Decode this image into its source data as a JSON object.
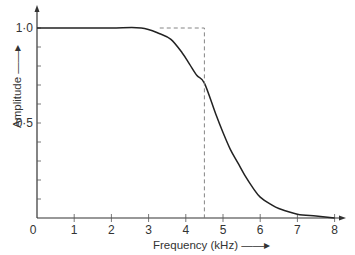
{
  "chart_data": {
    "type": "line",
    "title": "",
    "xlabel": "Frequency (kHz)",
    "ylabel": "Amplitude",
    "xlim": [
      0,
      8
    ],
    "ylim": [
      0,
      1.0
    ],
    "x_ticks": [
      "0",
      "1",
      "2",
      "3",
      "4",
      "5",
      "6",
      "7",
      "8"
    ],
    "y_ticks": [
      "1·0",
      "0·5"
    ],
    "y_minor_ticks_step": 0.1,
    "grid": false,
    "legend": null,
    "series": [
      {
        "name": "Filter response",
        "style": "solid",
        "x": [
          0,
          1,
          2,
          2.8,
          3.3,
          3.6,
          3.9,
          4.1,
          4.3,
          4.5,
          4.8,
          5.0,
          5.2,
          5.4,
          5.6,
          5.8,
          6.0,
          6.3,
          6.5,
          7.0,
          7.5,
          8.0
        ],
        "y": [
          1.0,
          1.0,
          1.0,
          1.0,
          0.97,
          0.94,
          0.87,
          0.81,
          0.75,
          0.71,
          0.55,
          0.45,
          0.36,
          0.29,
          0.22,
          0.16,
          0.11,
          0.07,
          0.05,
          0.02,
          0.01,
          0.0
        ]
      },
      {
        "name": "Ideal cutoff",
        "style": "dashed",
        "x": [
          3.3,
          4.5,
          4.5
        ],
        "y": [
          1.0,
          1.0,
          0.0
        ]
      }
    ]
  },
  "axes": {
    "xlabel": "Frequency (kHz) ——▸",
    "ylabel": "Amplitude ——▸",
    "x_tick_labels": [
      "0",
      "1",
      "2",
      "3",
      "4",
      "5",
      "6",
      "7",
      "8"
    ],
    "y_tick_labels": [
      "1·0",
      "0·5"
    ]
  }
}
